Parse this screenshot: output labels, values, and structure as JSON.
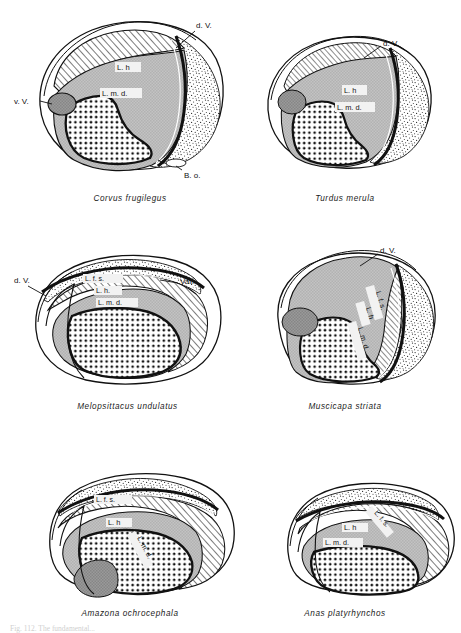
{
  "plate": {
    "background_color": "#ffffff",
    "ink_color": "#111111",
    "caption_bottom": "Fig. 112. The fundamental..."
  },
  "palette": {
    "solid_grey": "#b9b9b9",
    "dark_grey": "#8a8a8a",
    "hatch_fill": "#ffffff",
    "stipple_fill": "#ffffff",
    "white": "#ffffff",
    "outline": "#111111"
  },
  "legend_terms": {
    "d_v": "d. V.",
    "v_v": "v. V.",
    "b_o": "B. o.",
    "vall": "Vall.",
    "l_h": "L. h.",
    "l_m_d": "L. m. d.",
    "l_f_s": "L. f. s."
  },
  "panels": [
    {
      "id": "corvus-frugilegus",
      "species": "Corvus frugilegus",
      "row": 0,
      "col": 0,
      "labels": [
        {
          "name": "d-v",
          "text": "d. V.",
          "x": 196,
          "y": 28,
          "anchor": "start"
        },
        {
          "name": "v-v",
          "text": "v. V.",
          "x": 22,
          "y": 104,
          "anchor": "start"
        },
        {
          "name": "b-o",
          "text": "B. o.",
          "x": 187,
          "y": 175,
          "anchor": "start"
        },
        {
          "name": "l-h",
          "text": "L. h",
          "x": 117,
          "y": 70,
          "anchor": "start"
        },
        {
          "name": "l-m-d",
          "text": "L. m. d.",
          "x": 102,
          "y": 96,
          "anchor": "start"
        }
      ]
    },
    {
      "id": "turdus-merula",
      "species": "Turdus merula",
      "row": 0,
      "col": 1,
      "labels": [
        {
          "name": "d-v",
          "text": "d. V.",
          "x": 383,
          "y": 46,
          "anchor": "start"
        },
        {
          "name": "l-h",
          "text": "L. h",
          "x": 344,
          "y": 93,
          "anchor": "start"
        },
        {
          "name": "l-m-d",
          "text": "L. m. d.",
          "x": 337,
          "y": 110,
          "anchor": "start"
        }
      ]
    },
    {
      "id": "melopsittacus-undulatus",
      "species": "Melopsittacus undulatus",
      "row": 1,
      "col": 0,
      "labels": [
        {
          "name": "d-v",
          "text": "d. V.",
          "x": 20,
          "y": 283,
          "anchor": "start"
        },
        {
          "name": "vall",
          "text": "Vall.",
          "x": 180,
          "y": 284,
          "anchor": "start"
        },
        {
          "name": "l-f-s",
          "text": "L. f. s.",
          "x": 85,
          "y": 281,
          "anchor": "start"
        },
        {
          "name": "l-h",
          "text": "L. h.",
          "x": 96,
          "y": 293,
          "anchor": "start"
        },
        {
          "name": "l-m-d",
          "text": "L. m. d.",
          "x": 98,
          "y": 305,
          "anchor": "start"
        }
      ]
    },
    {
      "id": "muscicapa-striata",
      "species": "Muscicapa striata",
      "row": 1,
      "col": 1,
      "labels": [
        {
          "name": "d-v",
          "text": "d. V.",
          "x": 380,
          "y": 253,
          "anchor": "start"
        },
        {
          "name": "l-f-s",
          "text": "L. f. s.",
          "x": 376,
          "y": 292,
          "anchor": "start"
        },
        {
          "name": "l-h",
          "text": "L. h",
          "x": 366,
          "y": 308,
          "anchor": "start"
        },
        {
          "name": "l-m-d",
          "text": "L. m. d.",
          "x": 358,
          "y": 328,
          "anchor": "start"
        }
      ]
    },
    {
      "id": "amazona-ochrocephala",
      "species": "Amazona ochrocephala",
      "row": 2,
      "col": 0,
      "labels": [
        {
          "name": "l-f-s",
          "text": "L. f. s.",
          "x": 96,
          "y": 502,
          "anchor": "start"
        },
        {
          "name": "l-h",
          "text": "L. h",
          "x": 108,
          "y": 525,
          "anchor": "start"
        },
        {
          "name": "l-m-d",
          "text": "L. m. d.",
          "x": 137,
          "y": 538,
          "anchor": "start"
        }
      ]
    },
    {
      "id": "anas-platyrhynchos",
      "species": "Anas platyrhynchos",
      "row": 2,
      "col": 1,
      "labels": [
        {
          "name": "l-f-s",
          "text": "L. f. s.",
          "x": 374,
          "y": 513,
          "anchor": "start"
        },
        {
          "name": "l-h",
          "text": "L. h",
          "x": 344,
          "y": 530,
          "anchor": "start"
        },
        {
          "name": "l-m-d",
          "text": "L. m. d.",
          "x": 325,
          "y": 545,
          "anchor": "start"
        }
      ]
    }
  ],
  "captions": [
    {
      "id": "cap-0",
      "text": "Corvus frugilegus",
      "left": 20,
      "top": 194,
      "width": 220
    },
    {
      "id": "cap-1",
      "text": "Turdus merula",
      "left": 245,
      "top": 194,
      "width": 200
    },
    {
      "id": "cap-2",
      "text": "Melopsittacus undulatus",
      "left": 15,
      "top": 402,
      "width": 225
    },
    {
      "id": "cap-3",
      "text": "Muscicapa striata",
      "left": 245,
      "top": 402,
      "width": 200
    },
    {
      "id": "cap-4",
      "text": "Amazona ochrocephala",
      "left": 20,
      "top": 609,
      "width": 220
    },
    {
      "id": "cap-5",
      "text": "Anas platyrhynchos",
      "left": 245,
      "top": 609,
      "width": 200
    }
  ]
}
